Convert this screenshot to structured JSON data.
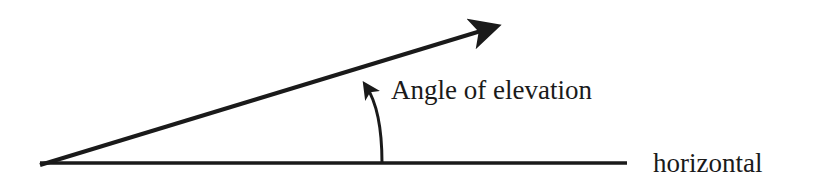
{
  "diagram": {
    "labels": {
      "angle": "Angle of elevation",
      "baseline": "horizontal"
    },
    "colors": {
      "stroke": "#1a1a1a",
      "background": "#ffffff"
    },
    "elements": [
      {
        "type": "line",
        "name": "horizontal-line"
      },
      {
        "type": "arrow",
        "name": "line-of-sight-arrow"
      },
      {
        "type": "curved-arrow",
        "name": "angle-arc-arrow"
      }
    ]
  }
}
